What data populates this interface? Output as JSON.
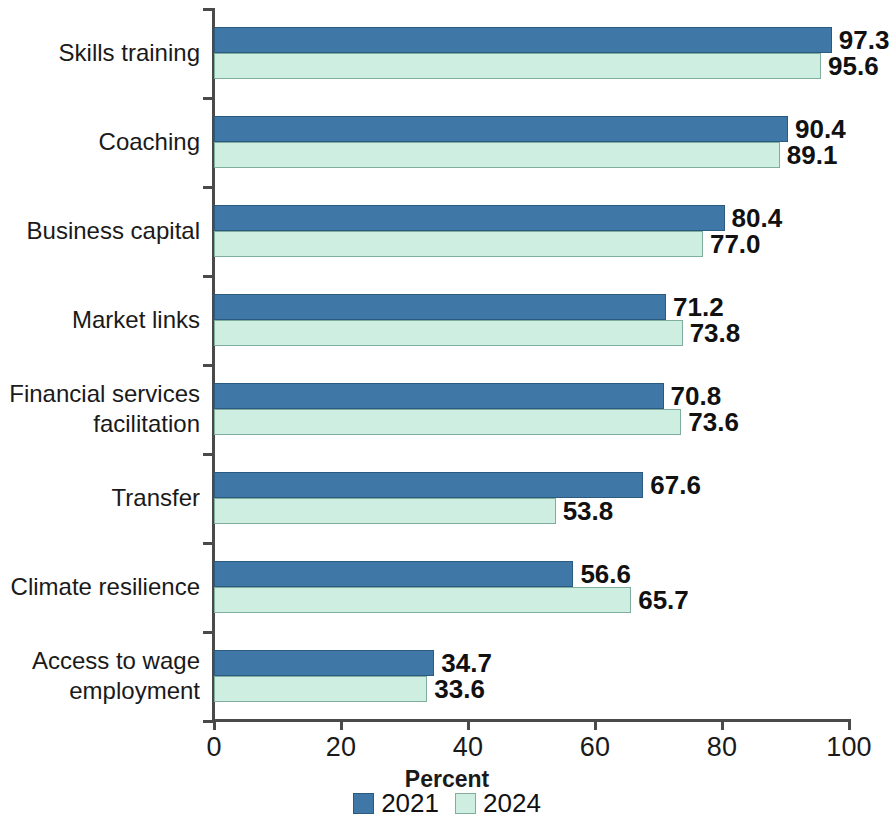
{
  "chart_data": {
    "type": "bar",
    "orientation": "horizontal",
    "title": "",
    "xlabel": "Percent",
    "ylabel": "",
    "xlim": [
      0,
      100
    ],
    "xticks": [
      0,
      20,
      40,
      60,
      80,
      100
    ],
    "xtick_labels": [
      "0",
      "20",
      "40",
      "60",
      "80",
      "100"
    ],
    "grid": false,
    "legend_position": "bottom-center",
    "categories": [
      "Skills training",
      "Coaching",
      "Business capital",
      "Market links",
      "Financial services\nfacilitation",
      "Transfer",
      "Climate resilience",
      "Access to wage\nemployment"
    ],
    "series": [
      {
        "name": "2021",
        "color": "#3f77a7",
        "values": [
          97.3,
          90.4,
          80.4,
          71.2,
          70.8,
          67.6,
          56.6,
          34.7
        ],
        "labels": [
          "97.3",
          "90.4",
          "80.4",
          "71.2",
          "70.8",
          "67.6",
          "56.6",
          "34.7"
        ]
      },
      {
        "name": "2024",
        "color": "#cdeee0",
        "values": [
          95.6,
          89.1,
          77.0,
          73.8,
          73.6,
          53.8,
          65.7,
          33.6
        ],
        "labels": [
          "95.6",
          "89.1",
          "77.0",
          "73.8",
          "73.6",
          "53.8",
          "65.7",
          "33.6"
        ]
      }
    ]
  }
}
